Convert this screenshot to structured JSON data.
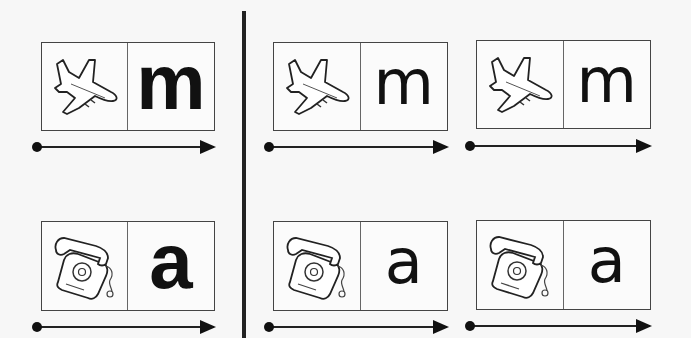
{
  "worksheet": {
    "divider": "vertical-separator",
    "rows": [
      {
        "picture": "airplane-icon",
        "letter": "m",
        "cards": [
          {
            "style": "bold",
            "letter": "m"
          },
          {
            "style": "thin",
            "letter": "m"
          },
          {
            "style": "thin",
            "letter": "m"
          }
        ]
      },
      {
        "picture": "telephone-icon",
        "letter": "a",
        "cards": [
          {
            "style": "bold",
            "letter": "a"
          },
          {
            "style": "thin",
            "letter": "a"
          },
          {
            "style": "thin",
            "letter": "a"
          }
        ]
      }
    ]
  }
}
